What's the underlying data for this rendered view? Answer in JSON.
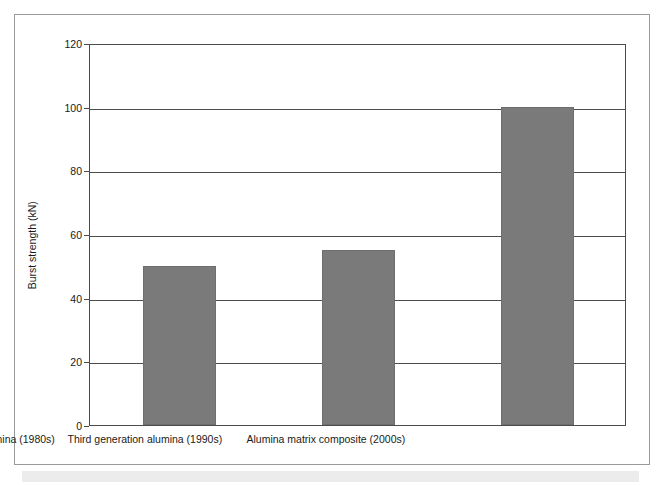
{
  "chart_data": {
    "type": "bar",
    "title": "",
    "subtitle": "",
    "xlabel": "",
    "ylabel": "Burst strength (kN)",
    "categories": [
      "Second generation alumina (1980s)",
      "Third generation alumina (1990s)",
      "Alumina matrix composite (2000s)"
    ],
    "values": [
      50,
      55,
      100
    ],
    "ylim": [
      0,
      120
    ],
    "yticks": [
      0,
      20,
      40,
      60,
      80,
      100,
      120
    ],
    "ytick_labels": [
      "0",
      "20",
      "40",
      "60",
      "80",
      "100",
      "120"
    ],
    "grid": "horizontal",
    "legend": "none",
    "bar_color": "#7a7a7a",
    "axis_color": "#4c4c4c",
    "background_color": "#ffffff",
    "frame_color": "#9a9a9a"
  },
  "figure": {
    "border_present": true,
    "scan_artifact_color": "#ececed"
  }
}
